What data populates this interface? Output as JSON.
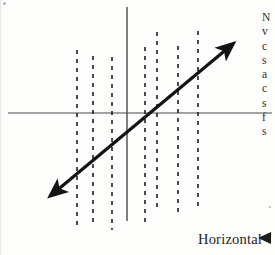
{
  "figure": {
    "caption": {
      "label": "Horizontal",
      "pointer_icon": "left-triangle-pointer-icon"
    },
    "axes": {
      "vertical_axis": {
        "x": 127,
        "y_top": 7,
        "y_bottom": 221,
        "color": "#4a4a4a"
      },
      "horizontal_axis": {
        "y": 113,
        "x_left": 8,
        "x_right": 272,
        "color": "#4a4a4a"
      }
    },
    "dashed_lines": {
      "color": "#1f1f1f",
      "dash_pattern": "4 5",
      "items": [
        {
          "x": 77,
          "y_top": 50,
          "y_bottom": 228
        },
        {
          "x": 93,
          "y_top": 56,
          "y_bottom": 222
        },
        {
          "x": 112,
          "y_top": 57,
          "y_bottom": 230
        },
        {
          "x": 145,
          "y_top": 47,
          "y_bottom": 224
        },
        {
          "x": 157,
          "y_top": 32,
          "y_bottom": 212
        },
        {
          "x": 178,
          "y_top": 46,
          "y_bottom": 215
        },
        {
          "x": 198,
          "y_top": 31,
          "y_bottom": 206
        }
      ]
    },
    "trend_line": {
      "type": "double-headed-arrow",
      "color": "#131313",
      "stroke_width": 3.2,
      "start": {
        "x": 55,
        "y": 192
      },
      "end": {
        "x": 228,
        "y": 48
      },
      "slope_description": "positive"
    }
  },
  "margin_text": {
    "lines": [
      "N",
      "v",
      "c",
      "s",
      "a",
      "c",
      "s",
      "f",
      "s"
    ]
  },
  "scan_specks": [
    {
      "x": 3,
      "y": 2,
      "d": 3
    },
    {
      "x": 269,
      "y": 206,
      "d": 2
    }
  ]
}
